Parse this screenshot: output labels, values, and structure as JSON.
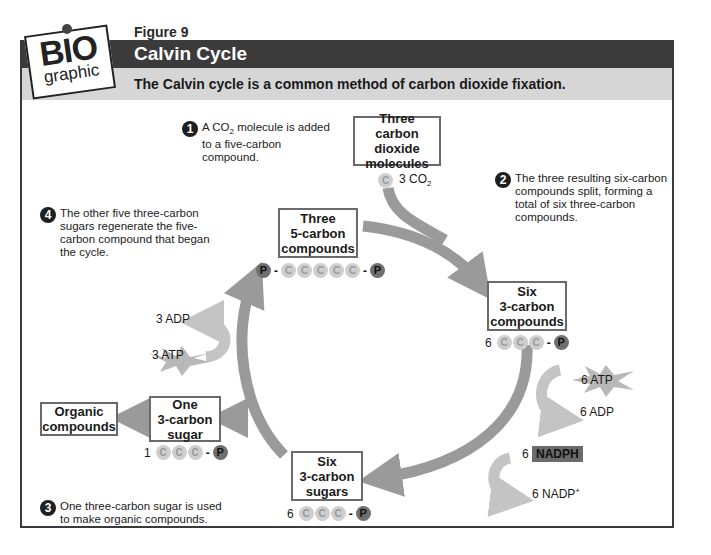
{
  "header": {
    "logo_top": "BIO",
    "logo_bottom": "graphic",
    "figure_label": "Figure 9",
    "title": "Calvin Cycle",
    "subtitle": "The Calvin cycle is a common method of carbon dioxide fixation."
  },
  "steps": [
    {
      "number": "1",
      "text_pre": "A CO",
      "text_sub": "2",
      "text_post": " molecule is added to a  five-carbon compound."
    },
    {
      "number": "2",
      "text": "The three resulting six-carbon compounds split, forming a total of six three-carbon compounds."
    },
    {
      "number": "3",
      "text": "One three-carbon sugar is used to make organic compounds."
    },
    {
      "number": "4",
      "text": "The other five three-carbon sugars regenerate the five-carbon compound that began the cycle."
    }
  ],
  "boxes": {
    "co2": {
      "line1": "Three",
      "line2": "carbon dioxide",
      "line3": "molecules"
    },
    "five_carbon": {
      "line1": "Three",
      "line2": "5-carbon",
      "line3": "compounds"
    },
    "six_three_carbon": {
      "line1": "Six",
      "line2": "3-carbon",
      "line3": "compounds"
    },
    "six_sugars": {
      "line1": "Six",
      "line2": "3-carbon",
      "line3": "sugars"
    },
    "one_sugar": {
      "line1": "One",
      "line2": "3-carbon",
      "line3": "sugar"
    },
    "organic": {
      "line1": "Organic",
      "line2": "compounds"
    }
  },
  "molecules": {
    "co2": {
      "carbon": "C",
      "label_pre": "3 CO",
      "label_sub": "2"
    },
    "five_carbon": {
      "p": "P",
      "c": "C"
    },
    "six_compounds": {
      "count": "6",
      "c": "C",
      "p": "P"
    },
    "six_sugars": {
      "count": "6",
      "c": "C",
      "p": "P"
    },
    "one_sugar": {
      "count": "1",
      "c": "C",
      "p": "P"
    }
  },
  "energy": {
    "atp6": "6 ATP",
    "adp6": "6 ADP",
    "nadph_count": "6",
    "nadph": "NADPH",
    "nadp_pre": "6 NADP",
    "nadp_sup": "+",
    "adp3": "3 ADP",
    "atp3": "3 ATP"
  },
  "colors": {
    "title_bar": "#3b3b3b",
    "subtitle_bar": "#d6d6d6",
    "cycle_arrow": "#9a9a9a",
    "energy_arrow": "#c4c4c4",
    "carbon": "#cfcfcf",
    "phosphate": "#6f6f6f"
  }
}
